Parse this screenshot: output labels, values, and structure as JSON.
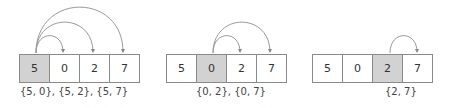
{
  "diagram": {
    "colors": {
      "highlight": "#d2d2d2",
      "border": "#8a8a8a",
      "arc": "#888888",
      "text": "#333333"
    },
    "panels": [
      {
        "values": [
          "5",
          "0",
          "2",
          "7"
        ],
        "highlight_index": 0,
        "arcs": [
          {
            "from": 0,
            "to": 1
          },
          {
            "from": 0,
            "to": 2
          },
          {
            "from": 0,
            "to": 3
          }
        ],
        "label": "{5, 0}, {5, 2}, {5, 7}"
      },
      {
        "values": [
          "5",
          "0",
          "2",
          "7"
        ],
        "highlight_index": 1,
        "arcs": [
          {
            "from": 1,
            "to": 2
          },
          {
            "from": 1,
            "to": 3
          }
        ],
        "label": "{0, 2}, {0, 7}"
      },
      {
        "values": [
          "5",
          "0",
          "2",
          "7"
        ],
        "highlight_index": 2,
        "arcs": [
          {
            "from": 2,
            "to": 3
          }
        ],
        "label": "{2, 7}"
      }
    ]
  }
}
